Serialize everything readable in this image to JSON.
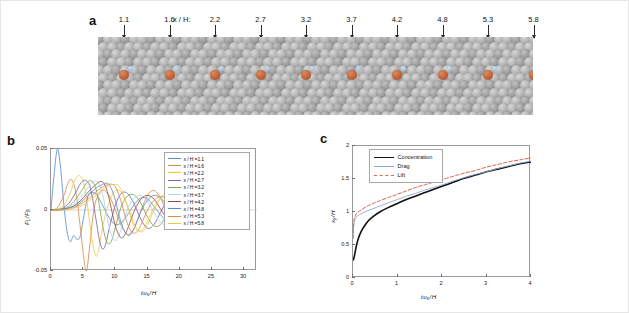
{
  "figure": {
    "background": "#ffffff",
    "border_color": "#e6e6e6"
  },
  "panel_a": {
    "letter": "a",
    "prefix_label": "x / H:",
    "positions": [
      "1.1",
      "1.6",
      "2.2",
      "2.7",
      "3.2",
      "3.7",
      "4.2",
      "4.8",
      "5.3",
      "5.8"
    ],
    "lattice_color": "#a8a8a8",
    "tracer_color": "#c4673c",
    "description": "granular bed of gray spheres with orange tracer particles"
  },
  "panel_b": {
    "letter": "b",
    "legend_labels": [
      "x / H =1.1",
      "x / H =1.6",
      "x / H =2.2",
      "x / H =2.7",
      "x / H =3.2",
      "x / H =3.7",
      "x / H =4.2",
      "x / H =4.8",
      "x / H =5.3",
      "x / H =5.8"
    ],
    "chart_data": {
      "type": "line",
      "title": "",
      "xlabel": "t u_s / H",
      "ylabel": "F_L / F_B",
      "xlim": [
        0,
        32
      ],
      "ylim": [
        -0.05,
        0.05
      ],
      "xticks": [
        0,
        5,
        10,
        15,
        20,
        25,
        30
      ],
      "xtick_labels": [
        "0",
        "5",
        "10",
        "15",
        "20",
        "25",
        "30"
      ],
      "yticks": [
        -0.05,
        0,
        0.05
      ],
      "ytick_labels": [
        "-0.05",
        "0",
        "0.05"
      ],
      "grid": false,
      "legend_position": "top-right",
      "series": [
        {
          "name": "x / H =1.1",
          "color": "#5a8fd0",
          "x": [
            0,
            0.5,
            1.0,
            1.5,
            2.0,
            2.5,
            3.0,
            3.5,
            4.0,
            4.5,
            5.0,
            5.5,
            6.0,
            7.0,
            8.0,
            9.0,
            10.0,
            11.0,
            12.0,
            13.0,
            14.0,
            15.0,
            16.0,
            17.0,
            18.0,
            19.0,
            20.0
          ],
          "values": [
            0,
            0.03,
            0.05,
            0.034,
            0.004,
            -0.018,
            -0.026,
            -0.021,
            -0.024,
            -0.022,
            -0.008,
            0.006,
            0.014,
            0.013,
            0.004,
            -0.006,
            -0.012,
            -0.01,
            -0.003,
            0.005,
            0.01,
            0.009,
            0.003,
            -0.004,
            -0.008,
            -0.007,
            -0.002
          ]
        },
        {
          "name": "x / H =1.6",
          "color": "#e08a4a",
          "x": [
            0,
            1,
            2,
            2.5,
            3,
            3.5,
            4,
            4.5,
            5,
            5.5,
            6,
            6.5,
            7,
            8,
            9,
            10,
            11,
            12,
            13,
            14,
            15,
            16,
            17,
            18,
            19,
            20
          ],
          "values": [
            0,
            0.002,
            0.012,
            0.02,
            0.025,
            0.022,
            0.01,
            -0.012,
            -0.035,
            -0.05,
            -0.03,
            -0.006,
            0.008,
            0.016,
            0.012,
            0.0,
            -0.014,
            -0.02,
            -0.014,
            0.0,
            0.012,
            0.016,
            0.01,
            -0.002,
            -0.012,
            -0.014
          ]
        },
        {
          "name": "x / H =2.2",
          "color": "#efc84a",
          "x": [
            0,
            1,
            2,
            3,
            3.5,
            4,
            4.5,
            5,
            5.5,
            6,
            6.5,
            7,
            7.5,
            8,
            9,
            10,
            11,
            12,
            13,
            14,
            15,
            16,
            17,
            18,
            19,
            20
          ],
          "values": [
            0,
            0.001,
            0.004,
            0.014,
            0.022,
            0.027,
            0.028,
            0.024,
            0.01,
            -0.01,
            -0.028,
            -0.038,
            -0.03,
            -0.014,
            0.006,
            0.016,
            0.014,
            0.002,
            -0.012,
            -0.018,
            -0.012,
            0.0,
            0.01,
            0.013,
            0.008,
            -0.001
          ]
        },
        {
          "name": "x / H =2.7",
          "color": "#8064a8",
          "x": [
            0,
            1,
            2,
            3,
            4,
            4.5,
            5,
            5.5,
            6,
            6.5,
            7,
            7.5,
            8,
            8.5,
            9,
            10,
            11,
            12,
            13,
            14,
            15,
            16,
            17,
            18,
            19,
            20
          ],
          "values": [
            0,
            0.0,
            0.002,
            0.007,
            0.016,
            0.021,
            0.024,
            0.024,
            0.02,
            0.008,
            -0.008,
            -0.024,
            -0.032,
            -0.028,
            -0.016,
            0.004,
            0.014,
            0.013,
            0.004,
            -0.008,
            -0.015,
            -0.012,
            -0.002,
            0.007,
            0.011,
            0.008
          ]
        },
        {
          "name": "x / H =3.2",
          "color": "#79ab4e",
          "x": [
            0,
            1,
            2,
            3,
            4,
            5,
            5.5,
            6,
            6.5,
            7,
            7.5,
            8,
            8.5,
            9,
            9.5,
            10,
            11,
            12,
            13,
            14,
            15,
            16,
            17,
            18,
            19,
            20
          ],
          "values": [
            0,
            0.0,
            0.001,
            0.004,
            0.01,
            0.018,
            0.022,
            0.024,
            0.023,
            0.017,
            0.004,
            -0.012,
            -0.024,
            -0.028,
            -0.024,
            -0.014,
            0.004,
            0.012,
            0.012,
            0.005,
            -0.006,
            -0.013,
            -0.012,
            -0.004,
            0.005,
            0.01
          ]
        },
        {
          "name": "x / H =3.7",
          "color": "#a8d8e8",
          "x": [
            0,
            1,
            2,
            3,
            4,
            5,
            6,
            6.5,
            7,
            7.5,
            8,
            8.5,
            9,
            9.5,
            10,
            10.5,
            11,
            12,
            13,
            14,
            15,
            16,
            17,
            18,
            19,
            20
          ],
          "values": [
            0,
            0.0,
            0.001,
            0.003,
            0.007,
            0.013,
            0.02,
            0.023,
            0.024,
            0.021,
            0.013,
            0.0,
            -0.013,
            -0.022,
            -0.025,
            -0.022,
            -0.014,
            0.002,
            0.01,
            0.012,
            0.007,
            -0.002,
            -0.01,
            -0.012,
            -0.006,
            0.003
          ]
        },
        {
          "name": "x / H =4.2",
          "color": "#9e4b3e",
          "x": [
            0,
            1,
            2,
            3,
            4,
            5,
            6,
            7,
            7.5,
            8,
            8.5,
            9,
            9.5,
            10,
            10.5,
            11,
            11.5,
            12,
            13,
            14,
            15,
            16,
            17,
            18,
            19,
            20
          ],
          "values": [
            0,
            0.0,
            0.001,
            0.002,
            0.005,
            0.01,
            0.016,
            0.021,
            0.023,
            0.023,
            0.019,
            0.01,
            -0.002,
            -0.013,
            -0.02,
            -0.023,
            -0.02,
            -0.014,
            0.0,
            0.009,
            0.012,
            0.009,
            0.001,
            -0.007,
            -0.011,
            -0.008
          ]
        },
        {
          "name": "x / H =4.8",
          "color": "#5a8fd0",
          "x": [
            0,
            2,
            3,
            4,
            5,
            6,
            7,
            8,
            8.5,
            9,
            9.5,
            10,
            10.5,
            11,
            11.5,
            12,
            12.5,
            13,
            14,
            15,
            16,
            17,
            18,
            19,
            20
          ],
          "values": [
            0,
            0.001,
            0.002,
            0.004,
            0.008,
            0.013,
            0.018,
            0.021,
            0.022,
            0.021,
            0.016,
            0.008,
            -0.003,
            -0.012,
            -0.018,
            -0.021,
            -0.019,
            -0.014,
            -0.001,
            0.008,
            0.012,
            0.01,
            0.003,
            -0.005,
            -0.01
          ]
        },
        {
          "name": "x / H =5.3",
          "color": "#e08a4a",
          "x": [
            0,
            2,
            3,
            4,
            5,
            6,
            7,
            8,
            9,
            9.5,
            10,
            10.5,
            11,
            11.5,
            12,
            12.5,
            13,
            13.5,
            14,
            15,
            16,
            17,
            18,
            19,
            20
          ],
          "values": [
            0,
            0.0,
            0.001,
            0.003,
            0.006,
            0.01,
            0.015,
            0.019,
            0.021,
            0.021,
            0.019,
            0.013,
            0.005,
            -0.005,
            -0.013,
            -0.018,
            -0.019,
            -0.017,
            -0.012,
            0.0,
            0.008,
            0.011,
            0.009,
            0.003,
            -0.004
          ]
        },
        {
          "name": "x / H =5.8",
          "color": "#efc84a",
          "x": [
            0,
            2,
            3,
            4,
            5,
            6,
            7,
            8,
            9,
            10,
            10.5,
            11,
            11.5,
            12,
            12.5,
            13,
            13.5,
            14,
            14.5,
            15,
            16,
            17,
            18,
            19,
            20
          ],
          "values": [
            0,
            0.0,
            0.001,
            0.002,
            0.004,
            0.008,
            0.012,
            0.017,
            0.02,
            0.021,
            0.02,
            0.016,
            0.009,
            0.001,
            -0.008,
            -0.014,
            -0.017,
            -0.017,
            -0.014,
            -0.009,
            0.002,
            0.009,
            0.011,
            0.008,
            0.002
          ]
        }
      ]
    }
  },
  "panel_c": {
    "letter": "c",
    "legend_labels": [
      "Concentration",
      "Drag",
      "Lift"
    ],
    "chart_data": {
      "type": "line",
      "title": "",
      "xlabel": "t u_s / H",
      "ylabel": "x_y / H",
      "xlim": [
        0,
        4
      ],
      "ylim": [
        0,
        2
      ],
      "xticks": [
        0,
        1,
        2,
        3,
        4
      ],
      "xtick_labels": [
        "0",
        "1",
        "2",
        "3",
        "4"
      ],
      "yticks": [
        0,
        0.5,
        1,
        1.5,
        2
      ],
      "ytick_labels": [
        "0",
        "0.5",
        "1",
        "1.5",
        "2"
      ],
      "grid": false,
      "legend_position": "top-left",
      "series": [
        {
          "name": "Concentration",
          "color": "#111111",
          "style": "solid",
          "width": 1.6,
          "x": [
            0.0,
            0.02,
            0.05,
            0.08,
            0.12,
            0.18,
            0.25,
            0.35,
            0.45,
            0.6,
            0.8,
            1.0,
            1.2,
            1.4,
            1.6,
            1.8,
            2.0,
            2.25,
            2.5,
            2.75,
            3.0,
            3.25,
            3.5,
            3.75,
            4.0
          ],
          "values": [
            0.27,
            0.3,
            0.4,
            0.5,
            0.6,
            0.7,
            0.78,
            0.87,
            0.93,
            1.0,
            1.07,
            1.13,
            1.19,
            1.24,
            1.29,
            1.34,
            1.39,
            1.45,
            1.51,
            1.56,
            1.61,
            1.65,
            1.69,
            1.73,
            1.76
          ]
        },
        {
          "name": "Drag",
          "color": "#8fa8c8",
          "style": "solid",
          "width": 0.9,
          "x": [
            0.0,
            0.02,
            0.05,
            0.1,
            0.2,
            0.3,
            0.45,
            0.6,
            0.8,
            1.0,
            1.2,
            1.4,
            1.6,
            1.8,
            2.0,
            2.25,
            2.5,
            2.75,
            3.0,
            3.25,
            3.5,
            3.75,
            4.0
          ],
          "values": [
            0.6,
            0.82,
            0.9,
            0.94,
            0.98,
            1.01,
            1.05,
            1.09,
            1.14,
            1.19,
            1.24,
            1.28,
            1.33,
            1.37,
            1.41,
            1.47,
            1.52,
            1.57,
            1.61,
            1.66,
            1.7,
            1.74,
            1.77
          ]
        },
        {
          "name": "Lift",
          "color": "#e0634a",
          "style": "dashed",
          "width": 1.0,
          "x": [
            0.0,
            0.02,
            0.05,
            0.1,
            0.2,
            0.3,
            0.45,
            0.6,
            0.8,
            1.0,
            1.2,
            1.4,
            1.6,
            1.8,
            2.0,
            2.25,
            2.5,
            2.75,
            3.0,
            3.25,
            3.5,
            3.75,
            4.0
          ],
          "values": [
            0.6,
            0.86,
            0.94,
            0.99,
            1.04,
            1.08,
            1.13,
            1.17,
            1.22,
            1.27,
            1.32,
            1.37,
            1.41,
            1.45,
            1.49,
            1.54,
            1.59,
            1.63,
            1.68,
            1.72,
            1.76,
            1.79,
            1.82
          ]
        }
      ]
    }
  }
}
